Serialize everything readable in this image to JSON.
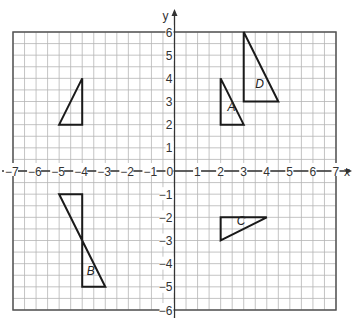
{
  "diagram": {
    "type": "coordinate-grid",
    "x_axis": {
      "label": "x",
      "min": -7,
      "max": 7,
      "ticks": [
        -7,
        -6,
        -5,
        -4,
        -3,
        -2,
        -1,
        0,
        1,
        2,
        3,
        4,
        5,
        6,
        7
      ]
    },
    "y_axis": {
      "label": "y",
      "min": -6,
      "max": 6,
      "ticks": [
        -6,
        -5,
        -4,
        -3,
        -2,
        -1,
        1,
        2,
        3,
        4,
        5,
        6
      ]
    },
    "grid_step": 0.5,
    "colors": {
      "grid": "#b5b5b5",
      "axis": "#333333",
      "shape": "#1a1a1a",
      "border": "#555555"
    },
    "shapes": [
      {
        "name": "unlabeled",
        "label": "",
        "points": [
          [
            -5,
            2
          ],
          [
            -4,
            2
          ],
          [
            -4,
            4
          ]
        ],
        "label_pos": null
      },
      {
        "name": "A",
        "label": "A",
        "points": [
          [
            2,
            4
          ],
          [
            2,
            2
          ],
          [
            3,
            2
          ]
        ],
        "label_pos": [
          2.3,
          2.6
        ]
      },
      {
        "name": "D",
        "label": "D",
        "points": [
          [
            3,
            6
          ],
          [
            3,
            3
          ],
          [
            4.5,
            3
          ]
        ],
        "label_pos": [
          3.5,
          3.6
        ]
      },
      {
        "name": "B-top",
        "label": "",
        "points": [
          [
            -5,
            -1
          ],
          [
            -4,
            -1
          ],
          [
            -4,
            -3
          ]
        ],
        "label_pos": null
      },
      {
        "name": "B",
        "label": "B",
        "points": [
          [
            -4,
            -3
          ],
          [
            -4,
            -5
          ],
          [
            -3,
            -5
          ]
        ],
        "label_pos": [
          -3.8,
          -4.5
        ]
      },
      {
        "name": "C",
        "label": "C",
        "points": [
          [
            2,
            -2
          ],
          [
            4,
            -2
          ],
          [
            2,
            -3
          ]
        ],
        "label_pos": [
          2.7,
          -2.35
        ]
      }
    ]
  }
}
